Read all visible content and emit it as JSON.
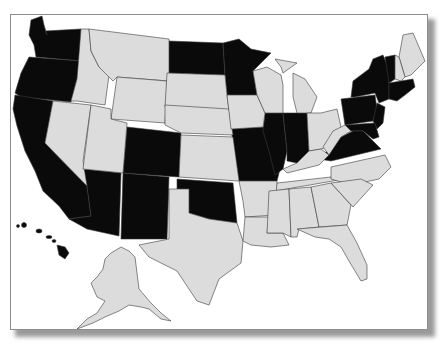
{
  "map": {
    "title": "United States map",
    "colors": {
      "highlighted": "#0a0a0a",
      "not_highlighted": "#dcdcdc",
      "border": "#3a3a3a",
      "background": "#ffffff"
    },
    "highlighted_states": [
      "WA",
      "OR",
      "CA",
      "AZ",
      "NM",
      "CO",
      "ND",
      "MN",
      "OK",
      "MO",
      "IL",
      "IN",
      "NY",
      "PA",
      "NJ",
      "DE",
      "MD",
      "VA",
      "VT",
      "MA",
      "CT",
      "RI",
      "HI"
    ],
    "not_highlighted_states": [
      "ID",
      "MT",
      "WY",
      "NV",
      "UT",
      "SD",
      "NE",
      "KS",
      "TX",
      "IA",
      "WI",
      "MI",
      "OH",
      "KY",
      "WV",
      "TN",
      "AR",
      "LA",
      "MS",
      "AL",
      "GA",
      "FL",
      "SC",
      "NC",
      "ME",
      "NH",
      "AK"
    ]
  }
}
